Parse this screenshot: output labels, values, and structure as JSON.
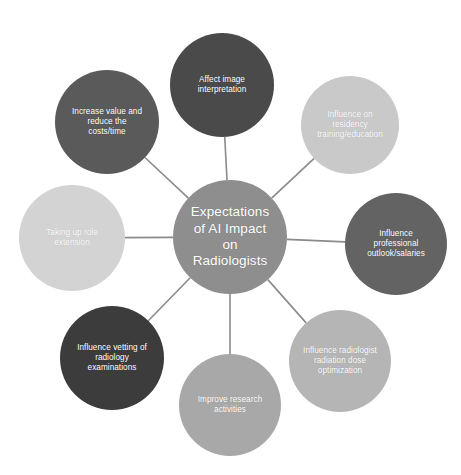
{
  "diagram": {
    "title": "Expectations of AI Impact on Radiologists",
    "type": "radial-hub-and-spoke",
    "background_color": "#ffffff",
    "connector_color": "#8a8a8a",
    "hub": {
      "id": "hub",
      "label": "Expectations\nof AI Impact\non\nRadiologists",
      "color": "#8e8e8e",
      "text_color": "#ffffff",
      "cx": 230,
      "cy": 237,
      "r": 57
    },
    "satellites": [
      {
        "id": "affect-image-interpretation",
        "label": "Affect image\ninterpretation",
        "color": "#4a4a4a",
        "text_color": "#ffffff",
        "cx": 222,
        "cy": 85,
        "r": 52,
        "angle_deg": 90
      },
      {
        "id": "influence-residency-training",
        "label": "Influence on\nresidency\ntraining/education",
        "color": "#c9c9c9",
        "text_color": "#ffffff",
        "cx": 350,
        "cy": 125,
        "r": 49,
        "angle_deg": 45
      },
      {
        "id": "influence-professional-outlook",
        "label": "Influence\nprofessional\noutlook/salaries",
        "color": "#636363",
        "text_color": "#ffffff",
        "cx": 396,
        "cy": 244,
        "r": 51,
        "angle_deg": 0
      },
      {
        "id": "influence-radiation-dose",
        "label": "Influence radiologist\nradiation dose\noptimization",
        "color": "#b5b5b5",
        "text_color": "#ffffff",
        "cx": 340,
        "cy": 361,
        "r": 51,
        "angle_deg": -45
      },
      {
        "id": "improve-research-activities",
        "label": "Improve research\nactivities",
        "color": "#a8a8a8",
        "text_color": "#ffffff",
        "cx": 230,
        "cy": 405,
        "r": 51,
        "angle_deg": -90
      },
      {
        "id": "influence-vetting-examinations",
        "label": "Influence vetting of\nradiology\nexaminations",
        "color": "#3c3c3c",
        "text_color": "#ffffff",
        "cx": 112,
        "cy": 358,
        "r": 52,
        "angle_deg": -135
      },
      {
        "id": "taking-up-role-extension",
        "label": "Taking up role\nextension",
        "color": "#d3d3d3",
        "text_color": "#ffffff",
        "cx": 72,
        "cy": 238,
        "r": 53,
        "angle_deg": 180
      },
      {
        "id": "increase-value-reduce-costs",
        "label": "Increase value and\nreduce the\ncosts/time",
        "color": "#5a5a5a",
        "text_color": "#ffffff",
        "cx": 107,
        "cy": 122,
        "r": 52,
        "angle_deg": 135
      }
    ]
  }
}
